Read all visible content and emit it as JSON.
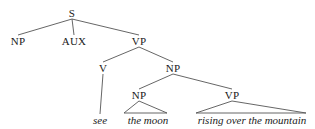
{
  "diagram": {
    "type": "syntax-tree",
    "nodes": [
      {
        "id": "S",
        "label": "S",
        "x": 72,
        "y": 13,
        "kind": "category"
      },
      {
        "id": "NP1",
        "label": "NP",
        "x": 18,
        "y": 41,
        "kind": "category"
      },
      {
        "id": "AUX",
        "label": "AUX",
        "x": 74,
        "y": 41,
        "kind": "category"
      },
      {
        "id": "VP1",
        "label": "VP",
        "x": 139,
        "y": 41,
        "kind": "category"
      },
      {
        "id": "V",
        "label": "V",
        "x": 103,
        "y": 68,
        "kind": "category"
      },
      {
        "id": "NP2",
        "label": "NP",
        "x": 173,
        "y": 68,
        "kind": "category"
      },
      {
        "id": "NP3",
        "label": "NP",
        "x": 139,
        "y": 95,
        "kind": "category"
      },
      {
        "id": "VP2",
        "label": "VP",
        "x": 232,
        "y": 95,
        "kind": "category"
      },
      {
        "id": "w_see",
        "label": "see",
        "x": 100,
        "y": 120,
        "kind": "word"
      },
      {
        "id": "w_moon",
        "label": "the moon",
        "x": 148,
        "y": 120,
        "kind": "word"
      },
      {
        "id": "w_rising",
        "label": "rising over the mountain",
        "x": 252,
        "y": 120,
        "kind": "word"
      }
    ],
    "edges": [
      {
        "from": "S",
        "to": "NP1"
      },
      {
        "from": "S",
        "to": "AUX"
      },
      {
        "from": "S",
        "to": "VP1"
      },
      {
        "from": "VP1",
        "to": "V"
      },
      {
        "from": "VP1",
        "to": "NP2"
      },
      {
        "from": "V",
        "to": "w_see"
      },
      {
        "from": "NP2",
        "to": "NP3"
      },
      {
        "from": "NP2",
        "to": "VP2"
      }
    ],
    "triangles": [
      {
        "apex": "NP3",
        "base_left_x": 124,
        "base_right_x": 167,
        "base_y": 113
      },
      {
        "apex": "VP2",
        "base_left_x": 196,
        "base_right_x": 306,
        "base_y": 113
      }
    ]
  }
}
